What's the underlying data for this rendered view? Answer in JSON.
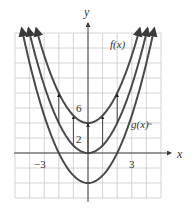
{
  "chart_data": {
    "type": "line",
    "title": "",
    "xlabel": "x",
    "ylabel": "y",
    "xlim": [
      -5,
      5
    ],
    "ylim": [
      -6,
      16
    ],
    "grid": true,
    "x_grid_step": 1,
    "y_grid_step": 2,
    "x_tick_labels": [
      {
        "value": -3,
        "label": "−3"
      },
      {
        "value": 3,
        "label": "3"
      }
    ],
    "y_tick_labels": [
      {
        "value": 6,
        "label": "6"
      },
      {
        "value": 2,
        "label": "2"
      }
    ],
    "series": [
      {
        "name": "f(x)",
        "formula": "x^2 + 4",
        "vertex": [
          0,
          4
        ],
        "label": "f(x)"
      },
      {
        "name": "g(x)",
        "formula": "x^2",
        "vertex": [
          0,
          0
        ],
        "label": "g(x)"
      },
      {
        "name": "lower curve",
        "formula": "x^2 - 4",
        "vertex": [
          0,
          -4
        ],
        "label": ""
      }
    ],
    "annotations": [
      {
        "type": "arrow",
        "from": [
          -2,
          4
        ],
        "to": [
          -2,
          8
        ]
      },
      {
        "type": "arrow",
        "from": [
          -1,
          1
        ],
        "to": [
          -1,
          5
        ]
      },
      {
        "type": "arrow",
        "from": [
          0,
          0
        ],
        "to": [
          0,
          4
        ]
      },
      {
        "type": "arrow",
        "from": [
          1,
          1
        ],
        "to": [
          1,
          5
        ]
      },
      {
        "type": "arrow",
        "from": [
          2,
          4
        ],
        "to": [
          2,
          8
        ]
      }
    ]
  },
  "labels": {
    "x_axis": "x",
    "y_axis": "y",
    "tick_neg3": "−3",
    "tick_3": "3",
    "tick_6": "6",
    "tick_2": "2",
    "f_label": "f(x)",
    "g_label": "g(x)"
  }
}
